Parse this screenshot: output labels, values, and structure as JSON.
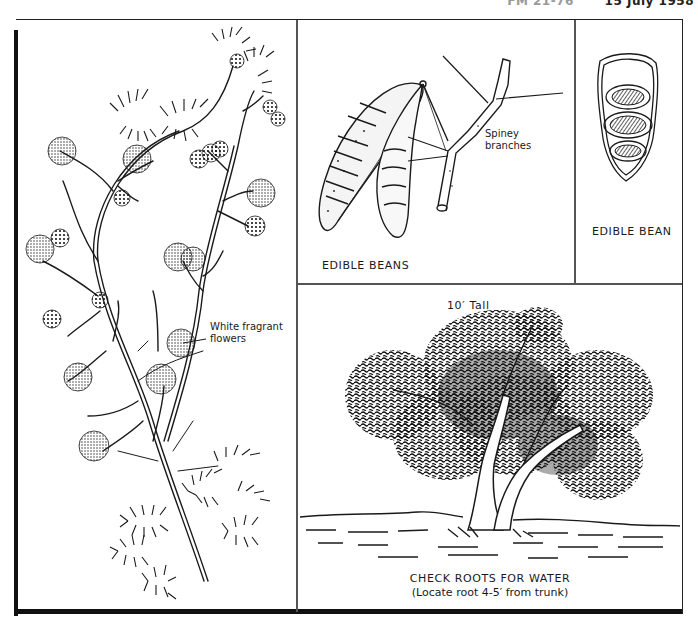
{
  "header": {
    "fragment_left": "FM 21-76",
    "fragment_right": "15 July 1958"
  },
  "panels": {
    "flowering_branch": {
      "callout": "White fragrant flowers",
      "callout_line1": "White fragrant",
      "callout_line2": "flowers",
      "icon": "acacia-branch-illustration"
    },
    "beans_and_branch": {
      "caption": "EDIBLE BEANS",
      "callout_line1": "Spiney",
      "callout_line2": "branches",
      "icon": "bean-pods-and-thorny-branch-illustration"
    },
    "single_bean": {
      "caption": "EDIBLE BEAN",
      "icon": "open-bean-pod-illustration"
    },
    "tree": {
      "height_label": "10′ Tall",
      "caption_line1": "CHECK ROOTS FOR WATER",
      "caption_line2": "(Locate root 4-5′ from trunk)",
      "icon": "acacia-tree-illustration"
    }
  },
  "colors": {
    "ink": "#1a1a1a",
    "paper": "#ffffff",
    "rule": "#555555"
  }
}
